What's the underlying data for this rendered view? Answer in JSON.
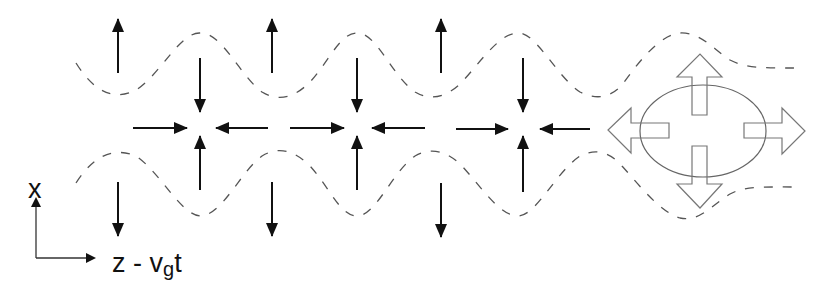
{
  "axes": {
    "vertical_label": "x",
    "horizontal_label_prefix": "z - v",
    "horizontal_label_subscript": "g",
    "horizontal_label_suffix": "t"
  },
  "colors": {
    "arrows": "#111111",
    "dashed_lines": "#555555",
    "bubble_outline": "#666666"
  },
  "field_arrows": {
    "vertical_pairs_x": [
      118,
      200,
      272,
      357,
      440,
      523
    ],
    "horizontal_arrows": [
      {
        "from": 133,
        "to": 187,
        "direction": "right"
      },
      {
        "from": 268,
        "to": 216,
        "direction": "left"
      },
      {
        "from": 290,
        "to": 344,
        "direction": "right"
      },
      {
        "from": 425,
        "to": 372,
        "direction": "left"
      },
      {
        "from": 456,
        "to": 508,
        "direction": "right"
      },
      {
        "from": 590,
        "to": 540,
        "direction": "left"
      }
    ]
  },
  "bubble": {
    "description": "ellipse with four outward hollow arrows",
    "center_x": 703,
    "center_y": 131
  }
}
